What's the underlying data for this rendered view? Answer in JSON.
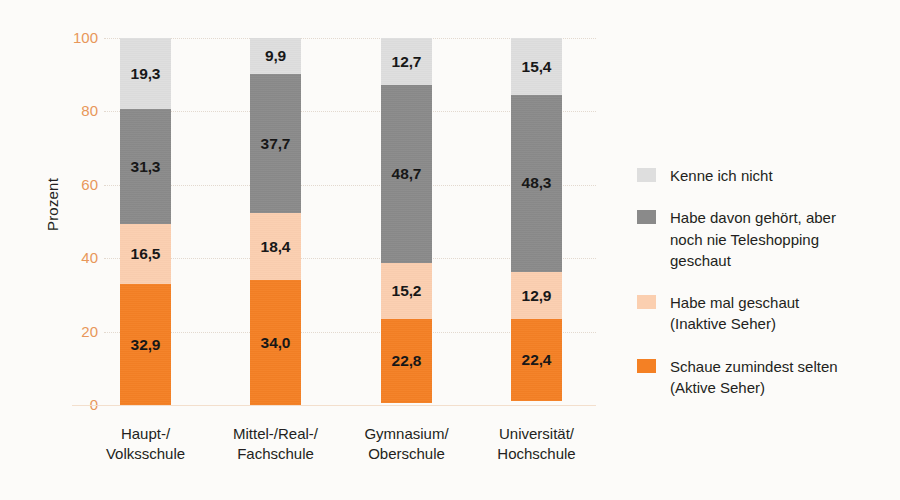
{
  "chart_data": {
    "type": "bar",
    "subtype": "stacked-bar-100",
    "title": "",
    "xlabel": "",
    "ylabel": "Prozent",
    "ylim": [
      0,
      100
    ],
    "yticks": [
      "0",
      "20",
      "40",
      "60",
      "80",
      "100"
    ],
    "grid": true,
    "legend_position": "right",
    "categories": [
      [
        "Haupt-/",
        "Volksschule"
      ],
      [
        "Mittel-/Real-/",
        "Fachschule"
      ],
      [
        "Gymnasium/",
        "Oberschule"
      ],
      [
        "Universität/",
        "Hochschule"
      ]
    ],
    "category_labels": [
      "Haupt-/ Volksschule",
      "Mittel-/Real-/ Fachschule",
      "Gymnasium/ Oberschule",
      "Universität/ Hochschule"
    ],
    "series": [
      {
        "name": "Schaue zumindest selten (Aktive Seher)",
        "legend_lines": [
          "Schaue zumindest selten",
          "(Aktive Seher)"
        ],
        "color": "#f48024",
        "values": [
          32.9,
          34.0,
          22.8,
          22.4
        ],
        "labels": [
          "32,9",
          "34,0",
          "22,8",
          "22,4"
        ]
      },
      {
        "name": "Habe mal geschaut (Inaktive Seher)",
        "legend_lines": [
          "Habe mal geschaut",
          "(Inaktive Seher)"
        ],
        "color": "#fbcfb0",
        "values": [
          16.5,
          18.4,
          15.2,
          12.9
        ],
        "labels": [
          "16,5",
          "18,4",
          "15,2",
          "12,9"
        ]
      },
      {
        "name": "Habe davon gehört, aber noch nie Teleshopping geschaut",
        "legend_lines": [
          "Habe davon gehört, aber",
          "noch nie Teleshopping",
          "geschaut"
        ],
        "color": "#8a8a8a",
        "values": [
          31.3,
          37.7,
          48.7,
          48.3
        ],
        "labels": [
          "31,3",
          "37,7",
          "48,7",
          "48,3"
        ]
      },
      {
        "name": "Kenne ich nicht",
        "legend_lines": [
          "Kenne ich nicht"
        ],
        "color": "#dedede",
        "values": [
          19.3,
          9.9,
          12.7,
          15.4
        ],
        "labels": [
          "19,3",
          "9,9",
          "12,7",
          "15,4"
        ]
      }
    ],
    "axis_tick_color": "#e8975a",
    "baseline_color": "#f3dfcd",
    "gridline_color": "#e3d9cf",
    "background_color": "#fcfbf9"
  }
}
